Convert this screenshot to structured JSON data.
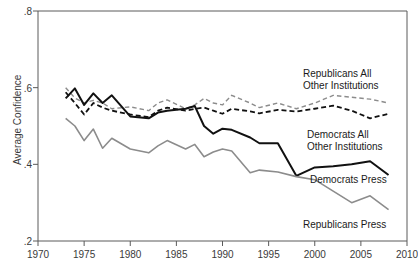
{
  "chart_data": {
    "type": "line",
    "title": "",
    "subtitle": "",
    "xlabel": "",
    "ylabel": "Average Confidence",
    "xlim": [
      1970,
      2010
    ],
    "ylim": [
      0.2,
      0.8
    ],
    "xticks": [
      1970,
      1975,
      1980,
      1985,
      1990,
      1995,
      2000,
      2005,
      2010
    ],
    "xticklabels": [
      "1970",
      "1975",
      "1980",
      "1985",
      "1990",
      "1995",
      "2000",
      "2005",
      "2010"
    ],
    "yticks": [
      0.2,
      0.4,
      0.6,
      0.8
    ],
    "yticklabels": [
      ".2",
      ".4",
      ".6",
      ".8"
    ],
    "grid": false,
    "legend_position": "inline-annotations",
    "series": [
      {
        "name": "Republicans All Other Institutions",
        "color": "#8c8c8c",
        "style": "dashed",
        "width": 1.4,
        "x": [
          1973,
          1974,
          1975,
          1976,
          1977,
          1978,
          1980,
          1982,
          1983,
          1984,
          1986,
          1987,
          1988,
          1989,
          1990,
          1991,
          1993,
          1994,
          1996,
          1998,
          2000,
          2002,
          2004,
          2006,
          2008
        ],
        "y": [
          0.6,
          0.573,
          0.56,
          0.567,
          0.56,
          0.545,
          0.55,
          0.54,
          0.56,
          0.568,
          0.545,
          0.555,
          0.572,
          0.56,
          0.555,
          0.58,
          0.56,
          0.548,
          0.56,
          0.545,
          0.56,
          0.58,
          0.575,
          0.57,
          0.56
        ]
      },
      {
        "name": "Democrats All Other Institutions",
        "color": "#111111",
        "style": "dashed",
        "width": 1.8,
        "x": [
          1973,
          1974,
          1975,
          1976,
          1977,
          1978,
          1980,
          1982,
          1983,
          1984,
          1986,
          1987,
          1988,
          1989,
          1990,
          1991,
          1993,
          1994,
          1996,
          1998,
          2000,
          2002,
          2004,
          2006,
          2008
        ],
        "y": [
          0.588,
          0.56,
          0.53,
          0.56,
          0.548,
          0.54,
          0.53,
          0.523,
          0.54,
          0.548,
          0.54,
          0.545,
          0.548,
          0.54,
          0.532,
          0.545,
          0.538,
          0.533,
          0.542,
          0.538,
          0.545,
          0.553,
          0.54,
          0.52,
          0.532
        ]
      },
      {
        "name": "Democrats Press",
        "color": "#111111",
        "style": "solid",
        "width": 2.0,
        "x": [
          1973,
          1974,
          1975,
          1976,
          1977,
          1978,
          1980,
          1982,
          1983,
          1984,
          1986,
          1987,
          1988,
          1989,
          1990,
          1991,
          1993,
          1994,
          1996,
          1998,
          2000,
          2002,
          2004,
          2006,
          2008
        ],
        "y": [
          0.572,
          0.598,
          0.555,
          0.585,
          0.56,
          0.58,
          0.525,
          0.52,
          0.535,
          0.54,
          0.545,
          0.552,
          0.5,
          0.48,
          0.493,
          0.49,
          0.47,
          0.455,
          0.455,
          0.37,
          0.392,
          0.395,
          0.4,
          0.408,
          0.372
        ]
      },
      {
        "name": "Republicans Press",
        "color": "#8c8c8c",
        "style": "solid",
        "width": 1.6,
        "x": [
          1973,
          1974,
          1975,
          1976,
          1977,
          1978,
          1980,
          1982,
          1983,
          1984,
          1986,
          1987,
          1988,
          1989,
          1990,
          1991,
          1993,
          1994,
          1996,
          1998,
          2000,
          2002,
          2004,
          2006,
          2008
        ],
        "y": [
          0.52,
          0.5,
          0.462,
          0.492,
          0.442,
          0.468,
          0.44,
          0.43,
          0.448,
          0.462,
          0.44,
          0.452,
          0.42,
          0.432,
          0.44,
          0.435,
          0.378,
          0.385,
          0.38,
          0.368,
          0.36,
          0.33,
          0.3,
          0.318,
          0.282
        ]
      }
    ],
    "annotations": [
      {
        "id": "republicans-all-other",
        "text_lines": [
          "Republicans All",
          "Other Institutions"
        ],
        "x": 303,
        "y": 68
      },
      {
        "id": "democrats-all-other",
        "text_lines": [
          "Democrats All",
          "Other Institutions"
        ],
        "x": 307,
        "y": 129
      },
      {
        "id": "democrats-press",
        "text_lines": [
          "Democrats Press"
        ],
        "x": 310,
        "y": 174
      },
      {
        "id": "republicans-press",
        "text_lines": [
          "Republicans Press"
        ],
        "x": 303,
        "y": 219
      }
    ]
  },
  "axes": {
    "ylabel": "Average Confidence",
    "frame_color": "#5a5a5a"
  }
}
